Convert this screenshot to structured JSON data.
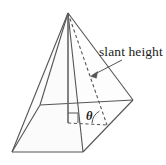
{
  "figure": {
    "labels": {
      "slant_height": "slant height",
      "theta": "θ"
    },
    "colors": {
      "stroke": "#555555",
      "base_fill": "#f0f0f0",
      "text": "#1a1a1a",
      "background": "#ffffff"
    },
    "geometry": {
      "apex": [
        68,
        13
      ],
      "base_vertices": {
        "left": [
          12,
          152
        ],
        "back": [
          40,
          105
        ],
        "right": [
          133,
          100
        ],
        "front": [
          83,
          152
        ]
      },
      "base_center": [
        68,
        122
      ],
      "slant_foot": [
        107,
        125
      ],
      "height_segment": [
        [
          68,
          13
        ],
        [
          68,
          122
        ]
      ],
      "slant_segment": [
        [
          68,
          13
        ],
        [
          107,
          125
        ]
      ],
      "apothem_segment": [
        [
          68,
          122
        ],
        [
          107,
          125
        ]
      ],
      "right_angle_marker": [
        [
          68,
          122
        ],
        [
          78,
          122
        ],
        [
          78,
          113
        ]
      ],
      "angle_arc_center": [
        107,
        125
      ],
      "leader_line": [
        [
          121,
          60
        ],
        [
          92,
          76
        ]
      ],
      "arrow_tip": [
        92,
        76
      ]
    },
    "elements": {
      "edge_apex_left": "apex-to-left-base-vertex-edge",
      "edge_apex_back": "apex-to-back-base-vertex-edge",
      "edge_apex_front": "apex-to-front-base-vertex-edge",
      "edge_apex_right": "apex-to-right-base-vertex-edge",
      "base_edge_left_front": "base-edge-left-front",
      "base_edge_front_right": "base-edge-front-right",
      "base_edge_left_back": "base-edge-left-back",
      "base_edge_back_right": "base-edge-back-right"
    }
  }
}
